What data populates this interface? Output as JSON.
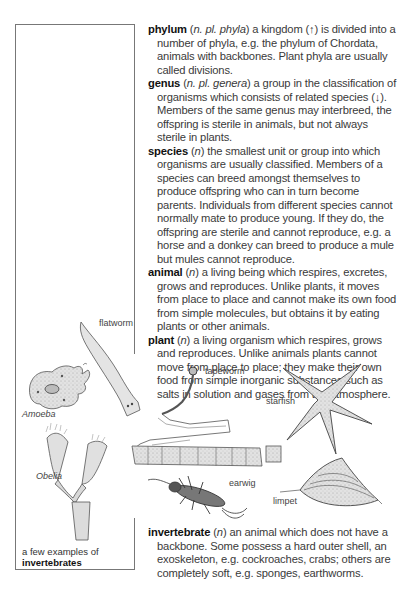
{
  "entries": [
    {
      "headword": "phylum",
      "grammar_open": " (",
      "grammar": "n. pl. phyla",
      "grammar_close": ")",
      "definition": " a kingdom (↑) is divided into a number of phyla, e.g. the phylum of Chordata, animals with backbones. Plant phyla are usually called divisions."
    },
    {
      "headword": "genus",
      "grammar_open": " (",
      "grammar": "n. pl. genera",
      "grammar_close": ")",
      "definition": " a group in the classification of organisms which consists of related species (↓). Members of the same genus may interbreed, the offspring is sterile in animals, but not always sterile in plants."
    },
    {
      "headword": "species",
      "grammar_open": " (",
      "grammar": "n",
      "grammar_close": ")",
      "definition": " the smallest unit or group into which organisms are usually classified. Members of a species can breed amongst themselves to produce offspring who can in turn become parents. Individuals from different species cannot normally mate to produce young. If they do, the offspring are sterile and cannot reproduce, e.g. a horse and a donkey can breed to produce a mule but mules cannot reproduce."
    },
    {
      "headword": "animal",
      "grammar_open": " (",
      "grammar": "n",
      "grammar_close": ")",
      "definition": " a living being which respires, excretes, grows and reproduces. Unlike plants, it moves from place to place and cannot make its own food from simple molecules, but obtains it by eating plants or other animals."
    },
    {
      "headword": "plant",
      "grammar_open": " (",
      "grammar": "n",
      "grammar_close": ")",
      "definition": " a living organism which respires, grows and reproduces. Unlike animals plants cannot move from place to place; they make their own food from simple inorganic substances such as salts in solution and gases from the atmosphere."
    }
  ],
  "invertebrate": {
    "headword": "invertebrate",
    "grammar_open": " (",
    "grammar": "n",
    "grammar_close": ")",
    "definition": " an animal which does not have a backbone. Some possess a hard outer shell, an exoskeleton, e.g. cockroaches, crabs; others are completely soft, e.g. sponges, earthworms."
  },
  "illustration": {
    "labels": {
      "flatworm": "flatworm",
      "amoeba": "Amoeba",
      "obelia": "Obelia",
      "tapeworm": "tapeworm",
      "starfish": "starfish",
      "earwig": "earwig",
      "limpet": "limpet"
    },
    "caption_line1": "a few examples of",
    "caption_line2": "invertebrates"
  }
}
